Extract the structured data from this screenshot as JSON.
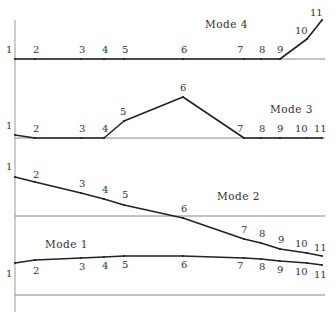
{
  "colors": {
    "curve": "#222222",
    "baseline": "#888888",
    "axis": "#999999",
    "text": "#333333"
  },
  "axis": {
    "x": 15,
    "y_top": 20,
    "y_bottom": 312
  },
  "node_x": [
    15,
    35,
    81,
    104,
    124,
    183,
    244,
    261,
    280,
    307,
    322
  ],
  "node_labels": [
    "1",
    "2",
    "3",
    "4",
    "5",
    "6",
    "7",
    "8",
    "9",
    "10",
    "11"
  ],
  "modes": [
    {
      "name": "Mode 4",
      "label_pos": [
        205,
        28
      ],
      "baseline_y": 59,
      "curve_y": [
        59,
        59,
        59,
        59,
        59,
        59,
        59,
        59,
        59,
        39,
        20
      ],
      "label_offsets": [
        [
          -9,
          -6
        ],
        [
          -2,
          -6
        ],
        [
          -2,
          -6
        ],
        [
          -2,
          -6
        ],
        [
          -2,
          -6
        ],
        [
          -2,
          -6
        ],
        [
          -7,
          -6
        ],
        [
          -2,
          -6
        ],
        [
          -3,
          -6
        ],
        [
          -12,
          -5
        ],
        [
          -12,
          -4
        ]
      ]
    },
    {
      "name": "Mode 3",
      "label_pos": [
        270,
        113
      ],
      "baseline_y": 138,
      "curve_y": [
        135,
        138,
        138,
        138,
        121,
        97,
        138,
        138,
        138,
        138,
        138
      ],
      "label_offsets": [
        [
          -9,
          -6
        ],
        [
          -2,
          -6
        ],
        [
          -2,
          -6
        ],
        [
          -2,
          -6
        ],
        [
          -4,
          -6
        ],
        [
          -3,
          -6
        ],
        [
          -7,
          -6
        ],
        [
          -2,
          -6
        ],
        [
          -3,
          -6
        ],
        [
          -12,
          -6
        ],
        [
          -8,
          -6
        ]
      ]
    },
    {
      "name": "Mode 2",
      "label_pos": [
        217,
        200
      ],
      "baseline_y": 216,
      "curve_y": [
        177,
        182,
        193,
        199,
        205,
        218,
        239,
        243,
        249,
        253,
        256
      ],
      "label_offsets": [
        [
          -9,
          -7
        ],
        [
          -2,
          -4
        ],
        [
          -2,
          -6
        ],
        [
          -2,
          -6
        ],
        [
          -2,
          -7
        ],
        [
          -2,
          -6
        ],
        [
          -3,
          -6
        ],
        [
          -2,
          -6
        ],
        [
          -2,
          -6
        ],
        [
          -12,
          -6
        ],
        [
          -8,
          -5
        ]
      ]
    },
    {
      "name": "Mode 1",
      "label_pos": [
        45,
        248
      ],
      "baseline_y": 295,
      "curve_y": [
        263,
        260,
        258,
        257,
        256,
        256,
        258,
        259,
        261,
        263,
        265
      ],
      "label_offsets": [
        [
          -9,
          14
        ],
        [
          -2,
          14
        ],
        [
          -2,
          12
        ],
        [
          -2,
          12
        ],
        [
          -2,
          12
        ],
        [
          -2,
          12
        ],
        [
          -7,
          11
        ],
        [
          -2,
          11
        ],
        [
          -3,
          12
        ],
        [
          -12,
          12
        ],
        [
          -8,
          13
        ]
      ]
    }
  ],
  "bottom_axis_y": 312
}
